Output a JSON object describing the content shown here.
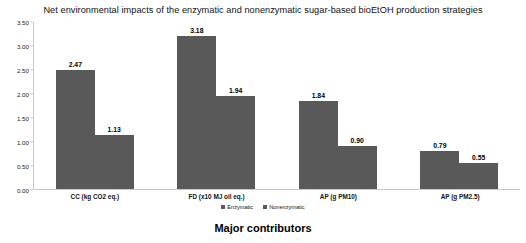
{
  "chart_data": {
    "type": "bar",
    "title": "Net environmental impacts of the enzymatic and nonenzymatic sugar-based bioEtOH production strategies",
    "xlabel": "Major contributors",
    "ylabel": "",
    "categories": [
      "CC (kg CO2 eq.)",
      "FD (x10 MJ oil eq.)",
      "AP (g PM10)",
      "AP (g PM2.5)"
    ],
    "series": [
      {
        "name": "Enzymatic",
        "values": [
          2.47,
          3.18,
          1.84,
          0.79
        ],
        "color": "#595959"
      },
      {
        "name": "Nonenzymatic",
        "values": [
          1.13,
          1.94,
          0.9,
          0.55
        ],
        "color": "#595959"
      }
    ],
    "value_labels": [
      [
        "2.47",
        "1.13"
      ],
      [
        "3.18",
        "1.94"
      ],
      [
        "1.84",
        "0.90"
      ],
      [
        "0.79",
        "0.55"
      ]
    ],
    "ylim": [
      0.0,
      3.5
    ],
    "yticks": [
      0.0,
      0.5,
      1.0,
      1.5,
      2.0,
      2.5,
      3.0,
      3.5
    ],
    "ytick_labels": [
      "0.00",
      "0.50",
      "1.00",
      "1.50",
      "2.00",
      "2.50",
      "3.00",
      "3.50"
    ],
    "grid": false,
    "legend_position": "bottom"
  }
}
